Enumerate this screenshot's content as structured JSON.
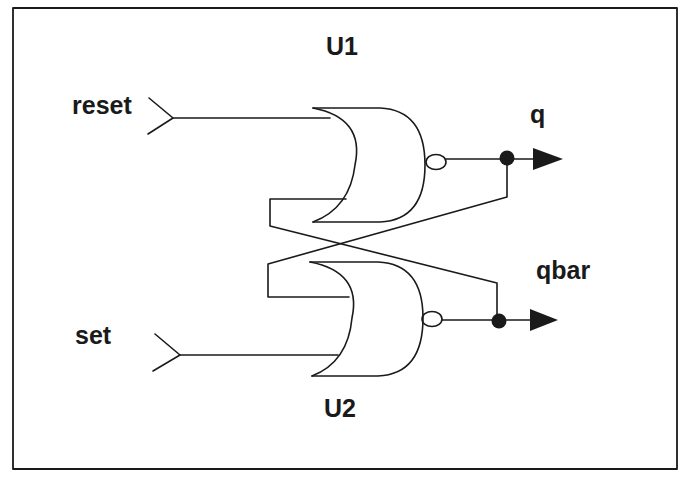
{
  "diagram": {
    "type": "SR latch (cross-coupled NOR gates)",
    "components": [
      {
        "id": "U1",
        "label": "U1",
        "kind": "NOR gate"
      },
      {
        "id": "U2",
        "label": "U2",
        "kind": "NOR gate"
      }
    ],
    "inputs": [
      {
        "name": "reset",
        "label": "reset",
        "connects_to": "U1"
      },
      {
        "name": "set",
        "label": "set",
        "connects_to": "U2"
      }
    ],
    "outputs": [
      {
        "name": "q",
        "label": "q",
        "driven_by": "U1"
      },
      {
        "name": "qbar",
        "label": "qbar",
        "driven_by": "U2"
      }
    ],
    "feedback": [
      {
        "from": "q",
        "to": "U2 input"
      },
      {
        "from": "qbar",
        "to": "U1 input"
      }
    ],
    "colors": {
      "stroke": "#1a1a1a",
      "background": "#ffffff"
    }
  }
}
